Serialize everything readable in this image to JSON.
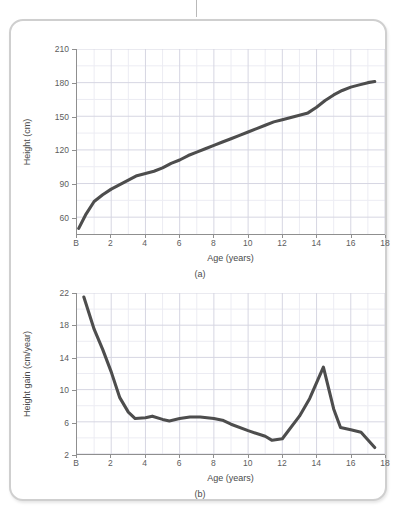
{
  "card": {
    "name": "figure-card"
  },
  "figures": [
    {
      "id": "a",
      "caption": "(a)",
      "xlabel": "Age (years)",
      "ylabel": "Height (cm)"
    },
    {
      "id": "b",
      "caption": "(b)",
      "xlabel": "Age (years)",
      "ylabel": "Height gain (cm/year)"
    }
  ],
  "colors": {
    "line": "#4d4d4d",
    "grid_major": "#d6d6e2",
    "grid_minor": "#ececf3",
    "axis": "#8f8f8f",
    "card_border": "#cfcfcf",
    "tick_text": "#5d5d5d"
  },
  "chart_data": [
    {
      "type": "line",
      "panel": "(a)",
      "title": "",
      "xlabel": "Age (years)",
      "ylabel": "Height (cm)",
      "xlim": [
        0,
        18
      ],
      "ylim": [
        45,
        210
      ],
      "xticks": [
        0,
        2,
        4,
        6,
        8,
        10,
        12,
        14,
        16,
        18
      ],
      "xtick_labels": [
        "B",
        "2",
        "4",
        "6",
        "8",
        "10",
        "12",
        "14",
        "16",
        "18"
      ],
      "yticks": [
        60,
        90,
        120,
        150,
        180,
        210
      ],
      "ytick_labels": [
        "60",
        "90",
        "120",
        "150",
        "180",
        "210"
      ],
      "grid": true,
      "minor_grid": true,
      "legend": "none",
      "series": [
        {
          "name": "Height",
          "x": [
            0.1,
            0.5,
            1.0,
            1.5,
            2.0,
            2.5,
            3.0,
            3.5,
            4.0,
            4.5,
            5.0,
            5.5,
            6.0,
            6.5,
            7.0,
            7.5,
            8.0,
            8.5,
            9.0,
            9.5,
            10.0,
            10.5,
            11.0,
            11.5,
            12.0,
            12.5,
            13.0,
            13.5,
            14.0,
            14.5,
            15.0,
            15.5,
            16.0,
            16.5,
            17.0,
            17.4
          ],
          "y": [
            50,
            62,
            74,
            80,
            85,
            89,
            93,
            97,
            99,
            101,
            104,
            108,
            111,
            115,
            118,
            121,
            124,
            127,
            130,
            133,
            136,
            139,
            142,
            145,
            147,
            149,
            151,
            153,
            158,
            164,
            169,
            173,
            176,
            178,
            180,
            181
          ]
        }
      ]
    },
    {
      "type": "line",
      "panel": "(b)",
      "title": "",
      "xlabel": "Age (years)",
      "ylabel": "Height gain (cm/year)",
      "xlim": [
        0,
        18
      ],
      "ylim": [
        2,
        22
      ],
      "xticks": [
        0,
        2,
        4,
        6,
        8,
        10,
        12,
        14,
        16,
        18
      ],
      "xtick_labels": [
        "B",
        "2",
        "4",
        "6",
        "8",
        "10",
        "12",
        "14",
        "16",
        "18"
      ],
      "yticks": [
        2,
        6,
        10,
        14,
        18,
        22
      ],
      "ytick_labels": [
        "2",
        "6",
        "10",
        "14",
        "18",
        "22"
      ],
      "grid": true,
      "minor_grid": true,
      "legend": "none",
      "series": [
        {
          "name": "Height gain",
          "x": [
            0.4,
            1.0,
            1.5,
            2.0,
            2.5,
            3.0,
            3.4,
            4.0,
            4.4,
            5.0,
            5.4,
            6.0,
            6.6,
            7.2,
            8.0,
            8.5,
            9.0,
            10.0,
            11.0,
            11.4,
            12.0,
            13.0,
            13.6,
            14.4,
            15.0,
            15.4,
            16.0,
            16.6,
            17.4
          ],
          "y": [
            21.5,
            17.5,
            15.0,
            12.2,
            9.0,
            7.2,
            6.4,
            6.5,
            6.7,
            6.3,
            6.1,
            6.4,
            6.6,
            6.6,
            6.4,
            6.2,
            5.7,
            4.9,
            4.2,
            3.7,
            3.9,
            6.7,
            8.9,
            12.8,
            7.6,
            5.3,
            5.0,
            4.7,
            2.8
          ]
        }
      ]
    }
  ]
}
